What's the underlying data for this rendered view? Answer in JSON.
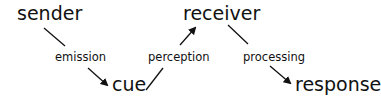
{
  "diagram": {
    "nodes": [
      {
        "id": "sender",
        "label": "sender"
      },
      {
        "id": "cue",
        "label": "cue"
      },
      {
        "id": "receiver",
        "label": "receiver"
      },
      {
        "id": "response",
        "label": "response"
      }
    ],
    "edges": [
      {
        "from": "sender",
        "to": "cue",
        "label": "emission"
      },
      {
        "from": "cue",
        "to": "receiver",
        "label": "perception"
      },
      {
        "from": "receiver",
        "to": "response",
        "label": "processing"
      }
    ],
    "colors": {
      "text": "#111111",
      "line": "#111111",
      "background": "#ffffff"
    }
  }
}
